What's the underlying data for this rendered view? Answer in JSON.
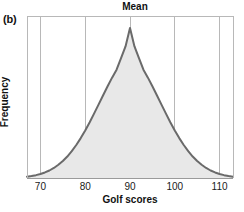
{
  "figure": {
    "panel_label": "(b)",
    "background_color": "#ffffff"
  },
  "chart_data": {
    "type": "area",
    "title": "Mean",
    "xlabel": "Golf scores",
    "ylabel": "Frequency",
    "grid": true,
    "legend": null,
    "xlim": [
      67,
      113
    ],
    "ylim": [
      0,
      1.08
    ],
    "xticks": [
      70,
      80,
      90,
      100,
      110
    ],
    "xtick_labels": [
      "70",
      "80",
      "90",
      "100",
      "110"
    ],
    "yticks": [],
    "ytick_labels": [],
    "distribution": {
      "shape": "normal",
      "mean": 90,
      "std_dev": 8.2,
      "peak_x": 90,
      "peak_y": 1.0
    },
    "annotations": [
      {
        "text": "Mean",
        "x": 90,
        "position": "above-axis-top",
        "gridline": true
      }
    ],
    "x": [
      67,
      68,
      69,
      70,
      71,
      72,
      73,
      74,
      75,
      76,
      77,
      78,
      79,
      80,
      81,
      82,
      83,
      84,
      85,
      86,
      87,
      88,
      89,
      90,
      91,
      92,
      93,
      94,
      95,
      96,
      97,
      98,
      99,
      100,
      101,
      102,
      103,
      104,
      105,
      106,
      107,
      108,
      109,
      110,
      111,
      112,
      113
    ],
    "values": [
      0.009,
      0.013,
      0.019,
      0.027,
      0.037,
      0.05,
      0.067,
      0.088,
      0.113,
      0.143,
      0.179,
      0.22,
      0.266,
      0.317,
      0.372,
      0.431,
      0.491,
      0.552,
      0.612,
      0.669,
      0.722,
      0.799,
      0.877,
      1.0,
      0.877,
      0.799,
      0.722,
      0.669,
      0.612,
      0.552,
      0.491,
      0.431,
      0.372,
      0.317,
      0.266,
      0.22,
      0.179,
      0.143,
      0.113,
      0.088,
      0.067,
      0.05,
      0.037,
      0.027,
      0.019,
      0.013,
      0.009
    ],
    "style": {
      "curve_color": "#6a6a6a",
      "fill_color": "#e8e8e8",
      "grid_color": "#b8b8b8",
      "axis_color": "#9a9a9a",
      "curve_width": 2
    }
  }
}
